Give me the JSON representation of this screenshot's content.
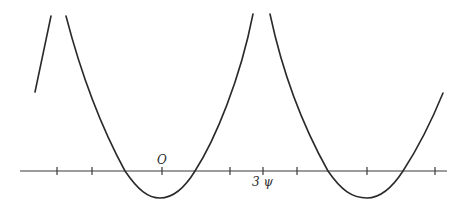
{
  "figure": {
    "colors": {
      "background": "#ffffff",
      "ink": "#2a2a2a"
    },
    "labels": {
      "origin": "O",
      "period_mark": "3 ψ"
    },
    "axis": {
      "y": 171,
      "x_start": 20,
      "x_end": 447
    },
    "ticks": [
      57,
      92,
      162,
      230,
      263,
      297,
      367,
      435
    ],
    "curves": [
      {
        "name": "left-branch",
        "d": "M35,92 C40,68 46,40 51,16"
      },
      {
        "name": "first-trough",
        "d": "M66,16 C80,70 100,125 125,171 C138,190 148,198 160,198 C172,198 184,189 195,171 C215,140 240,80 253,14"
      },
      {
        "name": "second-trough",
        "d": "M270,14 C283,75 305,130 328,171 C341,190 352,198 367,198 C380,198 392,188 403,171 C418,148 432,120 443,93"
      }
    ]
  }
}
